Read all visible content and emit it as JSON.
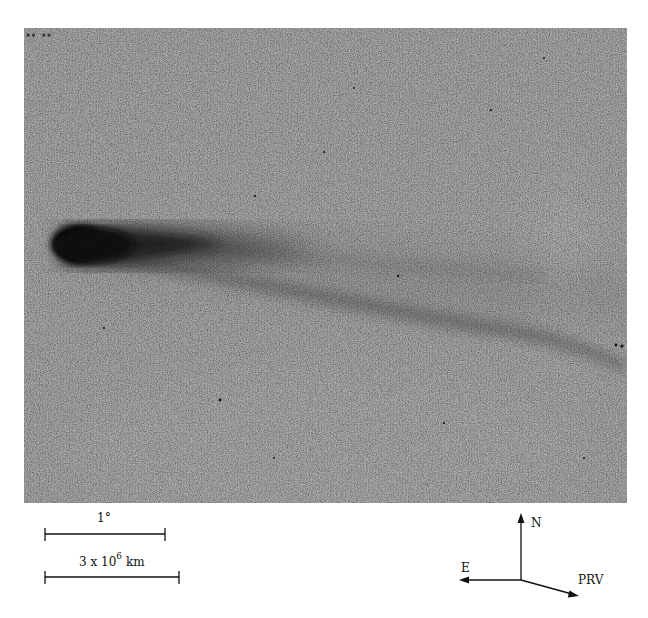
{
  "figure": {
    "background_color": "#a9a9a9",
    "coma_color": "#0a0a0a",
    "tail_color": "#5a5a5a"
  },
  "scale_bars": [
    {
      "label": "1°",
      "length_px": 120
    },
    {
      "label_base": "3 x 10",
      "label_exp": "6",
      "label_unit": "km",
      "length_px": 134
    }
  ],
  "compass": {
    "north_label": "N",
    "east_label": "E",
    "velocity_label": "PRV"
  }
}
